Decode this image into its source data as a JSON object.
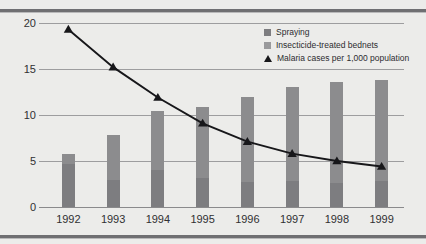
{
  "chart_data": {
    "type": "bar",
    "title": "",
    "subtitle": "",
    "xlabel": "",
    "ylabel": "",
    "categories": [
      "1992",
      "1993",
      "1994",
      "1995",
      "1996",
      "1997",
      "1998",
      "1999"
    ],
    "ylim": [
      0,
      20
    ],
    "yticks": [
      0,
      5,
      10,
      15,
      20
    ],
    "ytick_labels": [
      "0",
      "5",
      "10",
      "15",
      "20"
    ],
    "grid": true,
    "stacked": true,
    "legend_position": "top-right",
    "series": [
      {
        "name": "Spraying",
        "type": "bar",
        "color": "#7d7d80",
        "values": [
          4.7,
          2.9,
          4.0,
          3.1,
          2.7,
          2.8,
          2.6,
          2.8
        ]
      },
      {
        "name": "Insecticide-treated bednets",
        "type": "bar",
        "color": "#9a9a9c",
        "values": [
          1.1,
          4.9,
          6.4,
          7.8,
          9.3,
          10.2,
          11.0,
          11.0
        ]
      },
      {
        "name": "Malaria cases per 1,000 population",
        "type": "line",
        "marker": "triangle",
        "color": "#17171a",
        "values": [
          19.3,
          15.2,
          11.9,
          9.1,
          7.1,
          5.8,
          5.0,
          4.4
        ]
      }
    ],
    "bar_totals": [
      5.8,
      7.8,
      10.4,
      10.9,
      12.0,
      13.0,
      13.6,
      13.8
    ]
  },
  "legend": {
    "items": [
      {
        "label": "Spraying"
      },
      {
        "label": "Insecticide-treated bednets"
      },
      {
        "label": "Malaria cases per 1,000 population"
      }
    ]
  }
}
